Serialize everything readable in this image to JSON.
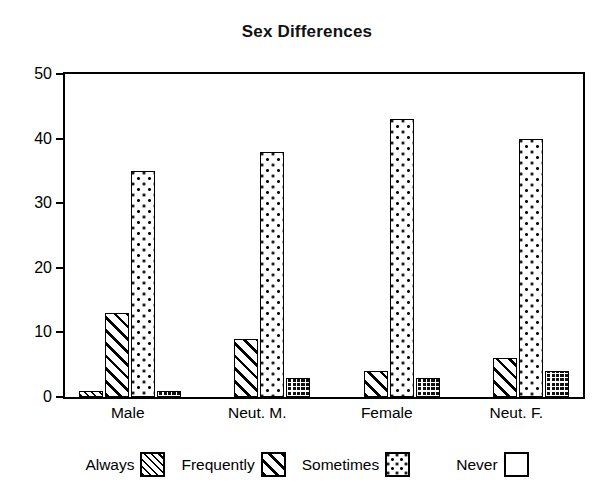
{
  "chart_data": {
    "type": "bar",
    "title": "Sex Differences",
    "xlabel": "",
    "ylabel": "",
    "ylim": [
      0,
      50
    ],
    "yticks": [
      0,
      10,
      20,
      30,
      40,
      50
    ],
    "grid": false,
    "legend_position": "bottom",
    "categories": [
      "Male",
      "Neut. M.",
      "Female",
      "Neut. F."
    ],
    "series": [
      {
        "name": "Always",
        "pattern": "fine-diagonal-hatch",
        "values": [
          1,
          0,
          0,
          0
        ]
      },
      {
        "name": "Frequently",
        "pattern": "wide-diagonal-hatch",
        "values": [
          13,
          9,
          4,
          6
        ]
      },
      {
        "name": "Sometimes",
        "pattern": "dots",
        "values": [
          35,
          38,
          43,
          40
        ]
      },
      {
        "name": "Never",
        "pattern": "dense-grid",
        "values": [
          1,
          3,
          3,
          4
        ]
      }
    ]
  },
  "axis": {
    "y_tick_labels": [
      "0",
      "10",
      "20",
      "30",
      "40",
      "50"
    ]
  },
  "legend": {
    "items": [
      {
        "label": "Always"
      },
      {
        "label": "Frequently"
      },
      {
        "label": "Sometimes"
      },
      {
        "label": "Never"
      }
    ]
  },
  "colors": {
    "ink": "#000000",
    "background": "#ffffff"
  }
}
